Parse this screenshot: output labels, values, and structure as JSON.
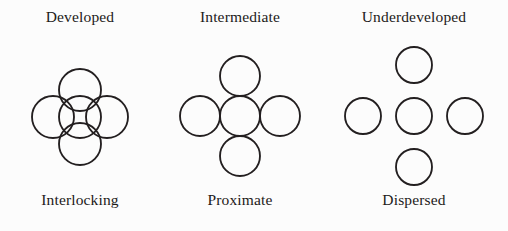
{
  "figure": {
    "background_color": "#fcfcfc",
    "stroke_color": "#231f20",
    "text_color": "#1c1a19"
  },
  "columns": [
    {
      "id": "developed-interlocking",
      "top_label": "Developed",
      "bottom_label": "Interlocking",
      "cluster": {
        "arrangement": "quincunx",
        "relationship": "overlapping",
        "circle_count": 5,
        "radius": 21,
        "offset": 27,
        "center_x": 65,
        "center_y": 77
      }
    },
    {
      "id": "intermediate-proximate",
      "top_label": "Intermediate",
      "bottom_label": "Proximate",
      "cluster": {
        "arrangement": "quincunx",
        "relationship": "tangent",
        "circle_count": 5,
        "radius": 20,
        "offset": 40,
        "center_x": 69,
        "center_y": 76
      }
    },
    {
      "id": "underdeveloped-dispersed",
      "top_label": "Underdeveloped",
      "bottom_label": "Dispersed",
      "cluster": {
        "arrangement": "quincunx",
        "relationship": "separated",
        "circle_count": 5,
        "radius": 18,
        "offset": 51,
        "center_x": 92,
        "center_y": 76
      }
    }
  ]
}
